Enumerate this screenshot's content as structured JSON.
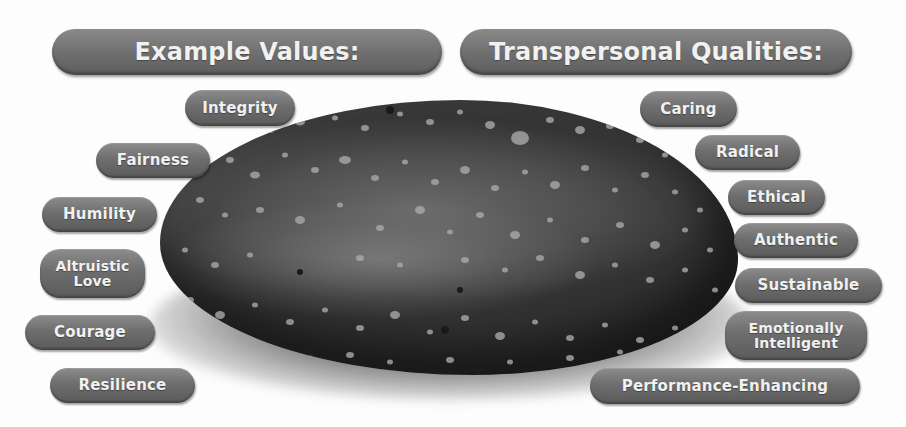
{
  "headers": {
    "left": "Example Values:",
    "right": "Transpersonal Qualities:"
  },
  "values": [
    {
      "label": "Integrity"
    },
    {
      "label": "Fairness"
    },
    {
      "label": "Humility"
    },
    {
      "label_lines": [
        "Altruistic",
        "Love"
      ]
    },
    {
      "label": "Courage"
    },
    {
      "label": "Resilience"
    }
  ],
  "qualities": [
    {
      "label": "Caring"
    },
    {
      "label": "Radical"
    },
    {
      "label": "Ethical"
    },
    {
      "label": "Authentic"
    },
    {
      "label": "Sustainable"
    },
    {
      "label_lines": [
        "Emotionally",
        "Intelligent"
      ]
    },
    {
      "label": "Performance-Enhancing"
    }
  ],
  "center_image": {
    "icon": "speckled-stone-icon",
    "colors": {
      "stone": "#3a3a3a",
      "speckle": "#a8a8a8",
      "pill": "#6e6e6e",
      "pill_text": "#f1f1f1"
    }
  }
}
